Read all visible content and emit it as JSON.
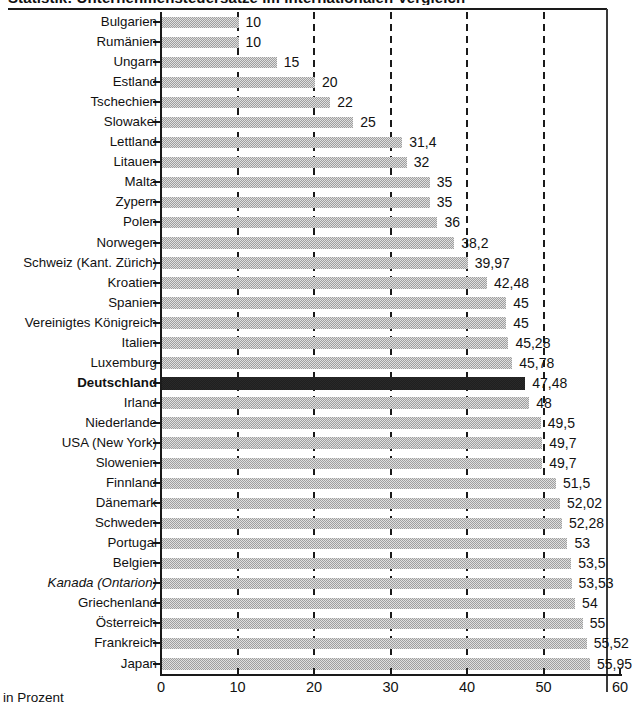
{
  "title": "Statistik: Unternehmensteuersätze im internationalen Vergleich",
  "axis_unit_label": "in Prozent",
  "x_ticks": [
    0,
    10,
    20,
    30,
    40,
    50,
    60
  ],
  "chart_data": {
    "type": "bar",
    "orientation": "horizontal",
    "title": "Statistik: Unternehmensteuersätze im internationalen Vergleich",
    "xlabel": "in Prozent",
    "ylabel": "",
    "xlim": [
      0,
      60
    ],
    "grid": "vertical-dashed",
    "legend": "none",
    "highlight": {
      "category": "Deutschland",
      "color": "#111111",
      "style": "bold-label"
    },
    "bar_color": "#b9b9b9",
    "categories": [
      "Bulgarien",
      "Rumänien",
      "Ungarn",
      "Estland",
      "Tschechien",
      "Slowakei",
      "Lettland",
      "Litauen",
      "Malta",
      "Zypern",
      "Polen",
      "Norwegen",
      "Schweiz (Kant. Zürich)",
      "Kroatien",
      "Spanien",
      "Vereinigtes Königreich",
      "Italien",
      "Luxemburg",
      "Deutschland",
      "Irland",
      "Niederlande",
      "USA (New York)",
      "Slowenien",
      "Finnland",
      "Dänemark",
      "Schweden",
      "Portugal",
      "Belgien",
      "Kanada (Ontarion)",
      "Griechenland",
      "Österreich",
      "Frankreich",
      "Japan"
    ],
    "values": [
      10,
      10,
      15,
      20,
      22,
      25,
      31.4,
      32,
      35,
      35,
      36,
      38.2,
      39.97,
      42.48,
      45,
      45,
      45.28,
      45.78,
      47.48,
      48,
      49.5,
      49.7,
      49.7,
      51.5,
      52.02,
      52.28,
      53,
      53.5,
      53.53,
      54,
      55,
      55.52,
      55.95
    ],
    "value_labels": [
      "10",
      "10",
      "15",
      "20",
      "22",
      "25",
      "31,4",
      "32",
      "35",
      "35",
      "36",
      "38,2",
      "39,97",
      "42,48",
      "45",
      "45",
      "45,28",
      "45,78",
      "47,48",
      "48",
      "49,5",
      "49,7",
      "49,7",
      "51,5",
      "52,02",
      "52,28",
      "53",
      "53,5",
      "53,53",
      "54",
      "55",
      "55,52",
      "55,95"
    ],
    "label_styles": [
      "normal",
      "normal",
      "normal",
      "normal",
      "normal",
      "normal",
      "normal",
      "normal",
      "normal",
      "normal",
      "normal",
      "normal",
      "normal",
      "normal",
      "normal",
      "normal",
      "normal",
      "normal",
      "bold",
      "normal",
      "normal",
      "normal",
      "normal",
      "normal",
      "normal",
      "normal",
      "normal",
      "normal",
      "italic",
      "normal",
      "normal",
      "normal",
      "normal"
    ]
  }
}
